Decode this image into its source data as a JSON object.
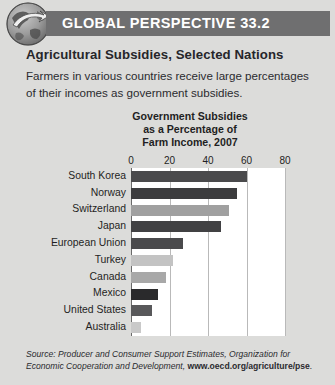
{
  "header": {
    "band_label": "GLOBAL PERSPECTIVE 33.2",
    "band_color": "#6f6f70",
    "globe_icon": "globe-arrow-icon"
  },
  "titles": {
    "subtitle": "Agricultural Subsidies, Selected Nations",
    "lede": "Farmers in various countries receive large percentages of their incomes as government subsidies."
  },
  "chart_data": {
    "type": "bar",
    "orientation": "horizontal",
    "title": "Government Subsidies as a Percentage of Farm Income, 2007",
    "title_line1": "Government Subsidies",
    "title_line2": "as a Percentage of",
    "title_line3": "Farm Income, 2007",
    "xlabel": "",
    "ylabel": "",
    "xlim": [
      0,
      80
    ],
    "ticks": [
      0,
      20,
      40,
      60,
      80
    ],
    "tick_labels": [
      "0",
      "20",
      "40",
      "60",
      "80"
    ],
    "grid": true,
    "legend": false,
    "categories": [
      "South Korea",
      "Norway",
      "Switzerland",
      "Japan",
      "European Union",
      "Turkey",
      "Canada",
      "Mexico",
      "United States",
      "Australia"
    ],
    "values": [
      60,
      55,
      51,
      47,
      27,
      22,
      18,
      14,
      11,
      5
    ],
    "bar_colors": [
      "#4a4a4c",
      "#3c3c3e",
      "#a0a0a0",
      "#414143",
      "#4a4a4c",
      "#c3c3c3",
      "#a8a8a8",
      "#2a2a2c",
      "#58585a",
      "#c9c9c9"
    ]
  },
  "source": {
    "prefix": "Source:",
    "body": " Producer and Consumer Support Estimates, Organization for Economic Cooperation and Development, ",
    "url": "www.oecd.org/agriculture/pse",
    "suffix": "."
  }
}
